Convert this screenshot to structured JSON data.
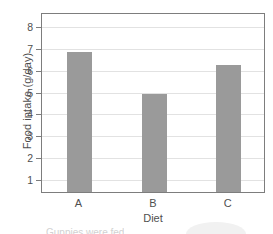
{
  "chart_data": {
    "type": "bar",
    "title": "",
    "xlabel": "Diet",
    "ylabel": "Food intake (g/day)",
    "categories": [
      "A",
      "B",
      "C"
    ],
    "values": [
      6.75,
      4.85,
      6.15
    ],
    "ylim": [
      0.35,
      8.6
    ],
    "yticks": [
      1,
      2,
      3,
      4,
      5,
      6,
      7,
      8
    ],
    "ytick_labels": [
      "1",
      "2",
      "3",
      "4",
      "5",
      "6",
      "7",
      "8"
    ],
    "grid": true,
    "legend": false,
    "bar_color": "#9a9a9a",
    "gridline_color": "#e2e2e2",
    "axis_color": "#7d7d7d",
    "text_color": "#4f4f4f"
  },
  "caption": {
    "text": "Guppies were fed"
  }
}
